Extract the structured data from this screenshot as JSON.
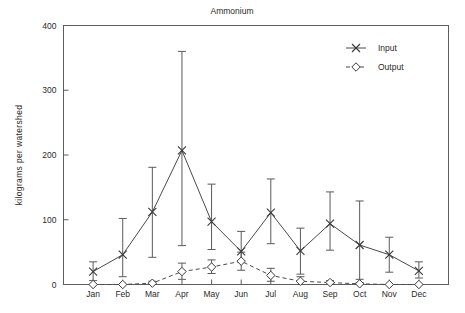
{
  "chart_data": {
    "type": "line",
    "title": "Ammonium",
    "xlabel": "",
    "ylabel": "kilograms per watershed",
    "categories": [
      "Jan",
      "Feb",
      "Mar",
      "Apr",
      "May",
      "Jun",
      "Jul",
      "Aug",
      "Sep",
      "Oct",
      "Nov",
      "Dec"
    ],
    "ylim": [
      0,
      400
    ],
    "yticks": [
      0,
      100,
      200,
      300,
      400
    ],
    "ytick_labels": [
      "0",
      "100",
      "200",
      "300",
      "400"
    ],
    "grid": false,
    "legend_position": "top-right",
    "series": [
      {
        "name": "Input",
        "marker": "x",
        "linestyle": "solid",
        "values": [
          20,
          46,
          112,
          207,
          97,
          51,
          111,
          52,
          94,
          61,
          46,
          21
        ],
        "error_low": [
          6,
          12,
          42,
          60,
          54,
          35,
          63,
          16,
          53,
          8,
          19,
          10
        ],
        "error_high": [
          35,
          102,
          181,
          360,
          155,
          82,
          163,
          87,
          143,
          129,
          73,
          35
        ]
      },
      {
        "name": "Output",
        "marker": "diamond",
        "linestyle": "dashed",
        "values": [
          0,
          0,
          2,
          20,
          27,
          36,
          14,
          5,
          3,
          1,
          0,
          0
        ],
        "error_low": [
          0,
          0,
          0,
          8,
          17,
          22,
          5,
          0,
          0,
          0,
          0,
          0
        ],
        "error_high": [
          0,
          0,
          5,
          33,
          38,
          50,
          25,
          12,
          6,
          3,
          0,
          0
        ]
      }
    ],
    "legend": [
      {
        "label": "Input",
        "marker": "x",
        "linestyle": "solid"
      },
      {
        "label": "Output",
        "marker": "diamond",
        "linestyle": "dashed"
      }
    ]
  }
}
